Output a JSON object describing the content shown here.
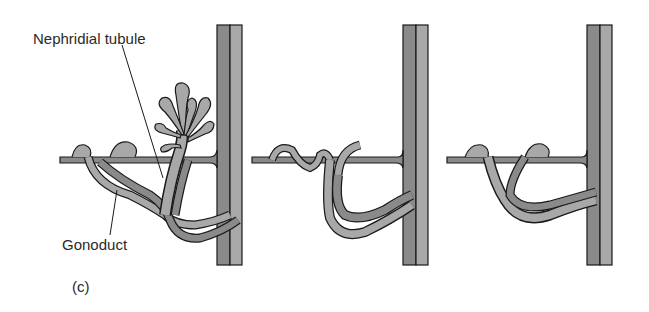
{
  "figure": {
    "panel_label": "(c)",
    "labels": {
      "nephridial_tubule": "Nephridial tubule",
      "gonoduct": "Gonoduct"
    },
    "panels": [
      {
        "id": "panel-1",
        "description": "Nephridial tubule with ciliated funnel and separate gonoduct"
      },
      {
        "id": "panel-2",
        "description": "Partially fused ducts"
      },
      {
        "id": "panel-3",
        "description": "Fully combined ducts"
      }
    ],
    "colors": {
      "fill_dark": "#8a8a8a",
      "fill_light": "#a8a8a8",
      "stroke": "#1a1a1a",
      "background": "#ffffff"
    }
  }
}
